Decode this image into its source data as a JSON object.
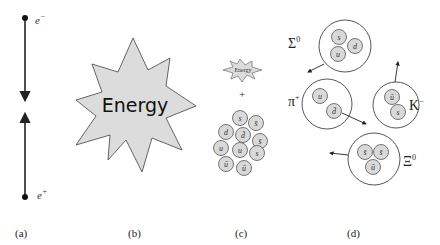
{
  "colors": {
    "stroke": "#444444",
    "fill_gray": "#d9d9d9",
    "hadron_fill": "#ffffff",
    "text": "#222222"
  },
  "panels": {
    "a": {
      "caption": "(a)",
      "particles": [
        {
          "label": "e",
          "sup": "−",
          "direction": "down"
        },
        {
          "label": "e",
          "sup": "+",
          "direction": "up"
        }
      ]
    },
    "b": {
      "caption": "(b)",
      "burst_text": "Energy"
    },
    "c": {
      "caption": "(c)",
      "burst_text": "Energy",
      "plus": "+",
      "quarks": [
        "s",
        "s̄",
        "d",
        "d̄",
        "s̄",
        "u",
        "u",
        "s",
        "ū",
        "ū"
      ]
    },
    "d": {
      "caption": "(d)",
      "hadrons": [
        {
          "name": "Σ",
          "sup": "0",
          "quarks": [
            "s",
            "d",
            "u"
          ]
        },
        {
          "name": "π",
          "sup": "+",
          "quarks": [
            "u",
            "d̄"
          ]
        },
        {
          "name": "K",
          "sup": "−",
          "quarks": [
            "ū",
            "s"
          ]
        },
        {
          "name": "Ξ",
          "sup": "0",
          "quarks": [
            "s̄",
            "s̄",
            "ū"
          ]
        }
      ]
    }
  }
}
